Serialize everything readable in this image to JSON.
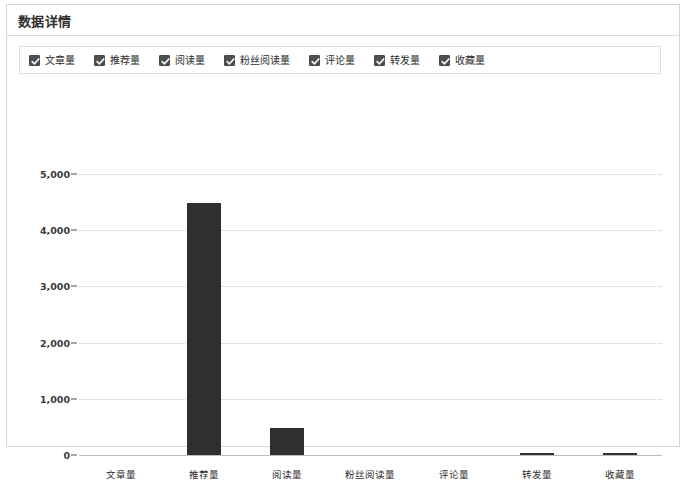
{
  "panel": {
    "title": "数据详情"
  },
  "legend": {
    "items": [
      {
        "label": "文章量",
        "checked": true,
        "icon": "checkbox-checked-icon"
      },
      {
        "label": "推荐量",
        "checked": true,
        "icon": "checkbox-checked-icon"
      },
      {
        "label": "阅读量",
        "checked": true,
        "icon": "checkbox-checked-icon"
      },
      {
        "label": "粉丝阅读量",
        "checked": true,
        "icon": "checkbox-checked-icon"
      },
      {
        "label": "评论量",
        "checked": true,
        "icon": "checkbox-checked-icon"
      },
      {
        "label": "转发量",
        "checked": true,
        "icon": "checkbox-checked-icon"
      },
      {
        "label": "收藏量",
        "checked": true,
        "icon": "checkbox-checked-icon"
      }
    ]
  },
  "colors": {
    "bar": "#2f2f2f",
    "grid": "#c9c9c9",
    "axis": "#bdbdbd",
    "panel_border": "#d4d4d4",
    "text": "#2b2b2b"
  },
  "chart_data": {
    "type": "bar",
    "title": "数据详情",
    "xlabel": "",
    "ylabel": "",
    "categories": [
      "文章量",
      "推荐量",
      "阅读量",
      "粉丝阅读量",
      "评论量",
      "转发量",
      "收藏量"
    ],
    "values": [
      0,
      4480,
      480,
      0,
      0,
      30,
      40
    ],
    "ylim": [
      0,
      5000
    ],
    "yticks": [
      0,
      1000,
      2000,
      3000,
      4000,
      5000
    ],
    "ytick_labels": [
      "0",
      "1,000",
      "2,000",
      "3,000",
      "4,000",
      "5,000"
    ],
    "grid": true,
    "grid_style": "dotted-horizontal",
    "legend": true,
    "legend_position": "top",
    "legend_entries": [
      "文章量",
      "推荐量",
      "阅读量",
      "粉丝阅读量",
      "评论量",
      "转发量",
      "收藏量"
    ],
    "series": [
      {
        "name": "数据详情",
        "values": [
          0,
          4480,
          480,
          0,
          0,
          30,
          40
        ]
      }
    ]
  }
}
